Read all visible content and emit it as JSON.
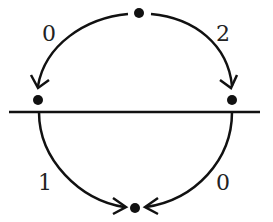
{
  "diagram": {
    "title": "",
    "nodes": [
      {
        "id": "top",
        "x": 139,
        "y": 13
      },
      {
        "id": "left",
        "x": 38,
        "y": 100
      },
      {
        "id": "right",
        "x": 232,
        "y": 100
      },
      {
        "id": "bottom",
        "x": 135,
        "y": 208
      }
    ],
    "edges": [
      {
        "from": "top",
        "to": "left",
        "label": "0"
      },
      {
        "from": "top",
        "to": "right",
        "label": "2"
      },
      {
        "from": "left",
        "to": "bottom",
        "label": "1"
      },
      {
        "from": "right",
        "to": "bottom",
        "label": "0"
      }
    ],
    "divider": {
      "x1": 9,
      "x2": 260,
      "y": 112
    },
    "labels": {
      "top_left": "0",
      "top_right": "2",
      "bottom_left": "1",
      "bottom_right": "0"
    },
    "colors": {
      "ink": "#111111",
      "background": "#ffffff"
    }
  }
}
